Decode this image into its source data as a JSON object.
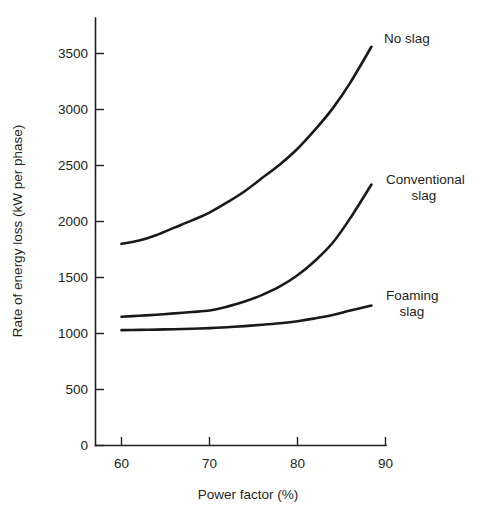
{
  "chart_data": {
    "type": "line",
    "title": "",
    "subtitle": "",
    "xlabel": "Power factor (%)",
    "ylabel": "Rate of energy loss (kW per phase)",
    "xlim": [
      57.5,
      91.5
    ],
    "ylim": [
      0,
      3750
    ],
    "grid": false,
    "legend_position": "inline-right",
    "xticks": [
      60,
      70,
      80,
      90
    ],
    "xtick_labels": [
      "60",
      "70",
      "80",
      "90"
    ],
    "yticks": [
      0,
      500,
      1000,
      1500,
      2000,
      2500,
      3000,
      3500
    ],
    "ytick_labels": [
      "0",
      "500",
      "1000",
      "1500",
      "2000",
      "2500",
      "3000",
      "3500"
    ],
    "x": [
      60,
      62,
      64,
      66,
      68,
      70,
      72,
      74,
      76,
      78,
      80,
      82,
      84,
      86,
      88.4
    ],
    "series": [
      {
        "name": "No slag",
        "label_lines": [
          "No slag"
        ],
        "values": [
          1800,
          1830,
          1880,
          1945,
          2010,
          2080,
          2170,
          2270,
          2390,
          2510,
          2650,
          2820,
          3010,
          3240,
          3560
        ]
      },
      {
        "name": "Conventional slag",
        "label_lines": [
          "Conventional",
          "slag"
        ],
        "values": [
          1150,
          1158,
          1168,
          1180,
          1192,
          1205,
          1240,
          1285,
          1345,
          1420,
          1520,
          1650,
          1810,
          2030,
          2330
        ]
      },
      {
        "name": "Foaming slag",
        "label_lines": [
          "Foaming",
          "slag"
        ],
        "values": [
          1030,
          1032,
          1035,
          1038,
          1042,
          1048,
          1056,
          1066,
          1078,
          1092,
          1110,
          1135,
          1165,
          1205,
          1250
        ]
      }
    ],
    "annotations": [
      {
        "text": "No slag",
        "x": 90.5,
        "y": 3640
      },
      {
        "text": "Conventional",
        "x": 92.0,
        "y": 2500
      },
      {
        "text": "slag",
        "x": 92.0,
        "y": 2360
      },
      {
        "text": "Foaming",
        "x": 91.6,
        "y": 1420
      },
      {
        "text": "slag",
        "x": 91.6,
        "y": 1280
      }
    ],
    "colors": {
      "curve": "#1a1a1a",
      "axis": "#231f20",
      "background": "#ffffff",
      "text": "#231f20"
    }
  }
}
